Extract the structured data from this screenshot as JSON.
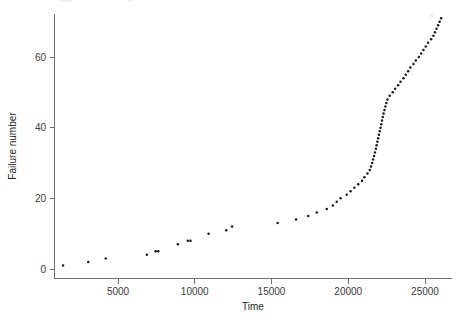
{
  "figure": {
    "title": "",
    "background_color": "#ffffff",
    "point_color": "#1a1a1a",
    "axis_color": "#6f6f6f",
    "text_color": "#231f20"
  },
  "axes": {
    "x": {
      "label": "Time",
      "ticks": [
        5000,
        10000,
        15000,
        20000,
        25000
      ],
      "tick_labels": [
        "5000",
        "10000",
        "15000",
        "20000",
        "25000"
      ],
      "range": [
        600,
        26800
      ]
    },
    "y": {
      "label": "Failure number",
      "ticks": [
        0,
        20,
        40,
        60
      ],
      "tick_labels": [
        "0",
        "20",
        "40",
        "60"
      ],
      "range": [
        -1,
        73
      ]
    }
  },
  "chart_data": {
    "type": "scatter",
    "title": "",
    "xlabel": "Time",
    "ylabel": "Failure number",
    "xlim": [
      600,
      26800
    ],
    "ylim": [
      -1,
      73
    ],
    "xticks": [
      5000,
      10000,
      15000,
      20000,
      25000
    ],
    "yticks": [
      0,
      20,
      40,
      60
    ],
    "grid": false,
    "legend": null,
    "marker": "dot",
    "marker_size": 2,
    "series": [
      {
        "name": "failures",
        "x": [
          1420,
          3060,
          4200,
          6880,
          7450,
          7620,
          8900,
          9550,
          9720,
          10900,
          12050,
          12430,
          15400,
          16600,
          17400,
          17950,
          18600,
          19000,
          19250,
          19500,
          19900,
          20150,
          20400,
          20650,
          20900,
          21050,
          21250,
          21400,
          21480,
          21560,
          21620,
          21680,
          21740,
          21800,
          21850,
          21900,
          21950,
          22000,
          22050,
          22100,
          22150,
          22200,
          22250,
          22300,
          22360,
          22420,
          22480,
          22550,
          22700,
          22900,
          23050,
          23250,
          23400,
          23600,
          23750,
          23900,
          24050,
          24250,
          24400,
          24600,
          24750,
          24900,
          25050,
          25200,
          25400,
          25550,
          25650,
          25750,
          25850,
          25950,
          26050
        ],
        "y": [
          1,
          2,
          3,
          4,
          5,
          5,
          7,
          8,
          8,
          10,
          11,
          12,
          13,
          14,
          15,
          16,
          17,
          18,
          19,
          20,
          21,
          22,
          23,
          24,
          25,
          26,
          27,
          28,
          29,
          30,
          31,
          32,
          33,
          34,
          35,
          36,
          37,
          38,
          39,
          40,
          41,
          42,
          43,
          44,
          45,
          46,
          47,
          48,
          49,
          50,
          51,
          52,
          53,
          54,
          55,
          56,
          57,
          58,
          59,
          60,
          61,
          62,
          63,
          64,
          65,
          66,
          67,
          68,
          69,
          70,
          71
        ]
      }
    ]
  }
}
